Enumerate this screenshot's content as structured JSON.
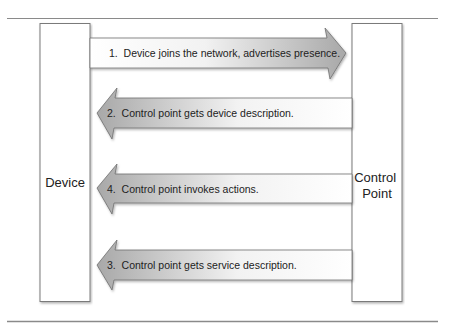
{
  "diagram": {
    "left_entity": "Device",
    "right_entity": [
      "Control",
      "Point"
    ],
    "colors": {
      "rule": "#8a8a8a",
      "box_border": "#7a7a7a",
      "arrow_dark": "#a9a9a9",
      "arrow_light": "#ffffff",
      "text": "#222222"
    },
    "arrows": [
      {
        "step": "1",
        "label": "1.  Device joins the network, advertises presence.",
        "direction": "right"
      },
      {
        "step": "2",
        "label": "2.  Control point gets device description.",
        "direction": "left"
      },
      {
        "step": "4",
        "label": "4.  Control point invokes actions.",
        "direction": "left"
      },
      {
        "step": "3",
        "label": "3.  Control point gets service description.",
        "direction": "left"
      }
    ]
  }
}
